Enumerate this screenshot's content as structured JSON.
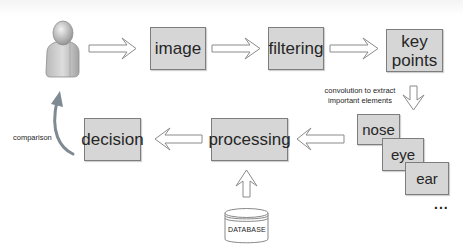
{
  "diagram": {
    "type": "flowchart",
    "nodes": {
      "user": {
        "icon": "user-icon"
      },
      "image": {
        "label": "image"
      },
      "filtering": {
        "label": "filtering"
      },
      "key_points": {
        "label_line1": "key",
        "label_line2": "points"
      },
      "nose": {
        "label": "nose"
      },
      "eye": {
        "label": "eye"
      },
      "ear": {
        "label": "ear"
      },
      "more": {
        "label": "..."
      },
      "processing": {
        "label": "processing"
      },
      "decision": {
        "label": "decision"
      },
      "database": {
        "label": "DATABASE",
        "icon": "database-icon"
      }
    },
    "annotations": {
      "convolution_line1": "convolution to extract",
      "convolution_line2": "important elements",
      "comparison": "comparison"
    },
    "edges": [
      {
        "from": "user",
        "to": "image"
      },
      {
        "from": "image",
        "to": "filtering"
      },
      {
        "from": "filtering",
        "to": "key_points"
      },
      {
        "from": "key_points",
        "to": "nose",
        "label": "convolution to extract important elements"
      },
      {
        "from": "nose",
        "to": "processing"
      },
      {
        "from": "database",
        "to": "processing"
      },
      {
        "from": "processing",
        "to": "decision"
      },
      {
        "from": "decision",
        "to": "user",
        "label": "comparison"
      }
    ],
    "colors": {
      "box_fill": "#d6d6d6",
      "box_border": "#7d7d7d",
      "arrow_stroke": "#8a8a8a",
      "curve_arrow": "#7f8a92"
    }
  }
}
